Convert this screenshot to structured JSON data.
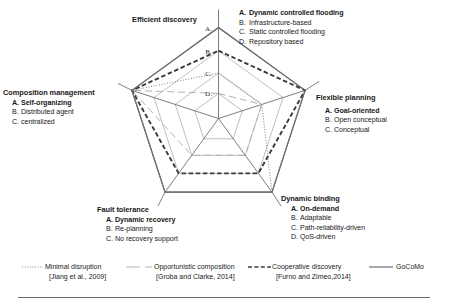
{
  "chart_data": {
    "type": "radar",
    "title": "",
    "axes": [
      {
        "name": "Efficient discovery",
        "angle_deg": 90,
        "levels": [
          "A",
          "B",
          "C",
          "D"
        ],
        "options": [
          {
            "key": "A.",
            "label": "Dynamic controlled flooding",
            "bold": true
          },
          {
            "key": "B.",
            "label": "Infrastructure-based",
            "bold": false
          },
          {
            "key": "C.",
            "label": "Static controlled flooding",
            "bold": false
          },
          {
            "key": "D.",
            "label": "Repository based",
            "bold": false
          }
        ]
      },
      {
        "name": "Flexible planning",
        "angle_deg": 18,
        "levels": [
          "A",
          "B",
          "C"
        ],
        "options": [
          {
            "key": "A.",
            "label": "Goal-oriented",
            "bold": true
          },
          {
            "key": "B.",
            "label": "Open conceptual",
            "bold": false
          },
          {
            "key": "C.",
            "label": "Conceptual",
            "bold": false
          }
        ]
      },
      {
        "name": "Dynamic binding",
        "angle_deg": 306,
        "levels": [
          "A",
          "B",
          "C",
          "D"
        ],
        "options": [
          {
            "key": "A.",
            "label": "On-demand",
            "bold": true
          },
          {
            "key": "B.",
            "label": "Adaptable",
            "bold": false
          },
          {
            "key": "C.",
            "label": "Path-reliability-driven",
            "bold": false
          },
          {
            "key": "D.",
            "label": "QoS-driven",
            "bold": false
          }
        ]
      },
      {
        "name": "Fault tolerance",
        "angle_deg": 234,
        "levels": [
          "A",
          "B",
          "C"
        ],
        "options": [
          {
            "key": "A.",
            "label": "Dynamic recovery",
            "bold": true
          },
          {
            "key": "B.",
            "label": "Re-planning",
            "bold": false
          },
          {
            "key": "C.",
            "label": "No recovery support",
            "bold": false
          }
        ]
      },
      {
        "name": "Composition management",
        "angle_deg": 162,
        "levels": [
          "A",
          "B",
          "C"
        ],
        "options": [
          {
            "key": "A.",
            "label": "Self-organizing",
            "bold": true
          },
          {
            "key": "B.",
            "label": "Distributed agent",
            "bold": false
          },
          {
            "key": "C.",
            "label": "centralized",
            "bold": false
          }
        ]
      }
    ],
    "scale_note": "A = outermost ring (best), D = innermost ring; center = 0",
    "series": [
      {
        "name": "Minimal disruption",
        "citation": "[Jiang et al., 2009]",
        "style": "dotted",
        "color": "#8c8c8c",
        "values": {
          "Efficient discovery": "C",
          "Flexible planning": "C",
          "Dynamic binding": "A",
          "Fault tolerance": "A",
          "Composition management": "A"
        }
      },
      {
        "name": "Opportunistic composition",
        "citation": "[Groba and Clarke, 2014]",
        "style": "dashed-thin",
        "color": "#b0b0b0",
        "values": {
          "Efficient discovery": "D",
          "Flexible planning": "C",
          "Dynamic binding": "C",
          "Fault tolerance": "C",
          "Composition management": "A"
        }
      },
      {
        "name": "Cooperative discovery",
        "citation": "[Furno and Zimeo,2014]",
        "style": "dashed-thick",
        "color": "#3a3a3a",
        "values": {
          "Efficient discovery": "B",
          "Flexible planning": "A",
          "Dynamic binding": "B",
          "Fault tolerance": "B",
          "Composition management": "A"
        }
      },
      {
        "name": "GoCoMo",
        "citation": "",
        "style": "solid",
        "color": "#6e6e6e",
        "values": {
          "Efficient discovery": "A",
          "Flexible planning": "A",
          "Dynamic binding": "A",
          "Fault tolerance": "A",
          "Composition management": "A"
        }
      }
    ],
    "legend_position": "bottom",
    "grid": true
  },
  "legend": [
    {
      "label": "Minimal disruption",
      "citation": "[Jiang et al., 2009]"
    },
    {
      "label": "Opportunistic composition",
      "citation": "[Groba and Clarke, 2014]"
    },
    {
      "label": "Cooperative discovery",
      "citation": "[Furno and Zimeo,2014]"
    },
    {
      "label": "GoCoMo",
      "citation": ""
    }
  ]
}
